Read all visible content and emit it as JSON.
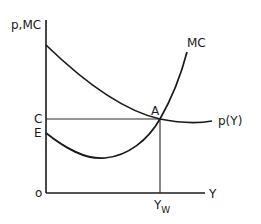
{
  "diagram": {
    "type": "economics-cost-price-diagram",
    "axes": {
      "y_label": "p,MC",
      "x_label": "Y",
      "origin_label": "o"
    },
    "curves": [
      {
        "name": "marginal-cost",
        "label": "MC",
        "shape": "U-shaped, rising steeply to the right"
      },
      {
        "name": "price",
        "label": "p(Y)",
        "shape": "downward-sloping, flattening to the right"
      }
    ],
    "points": {
      "intersection_label": "A",
      "price_level_label": "C",
      "mc_intercept_label": "E",
      "output_label_main": "Y",
      "output_label_sub": "W"
    },
    "colors": {
      "ink": "#1a1a1a",
      "background": "#ffffff"
    }
  }
}
